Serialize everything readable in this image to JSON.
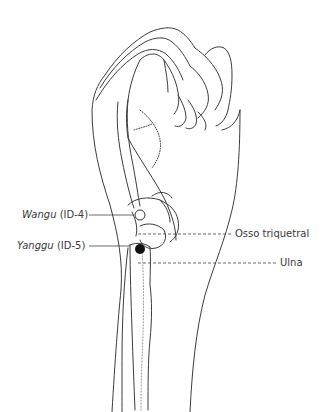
{
  "labels": {
    "wangu": {
      "name": "Wangu",
      "code": "(ID-4)"
    },
    "yanggu": {
      "name": "Yanggu",
      "code": "(ID-5)"
    },
    "triquetral": "Osso triquetral",
    "ulna": "Ulna"
  },
  "points": {
    "wangu_marker": "open-circle",
    "yanggu_marker": "filled-circle"
  }
}
